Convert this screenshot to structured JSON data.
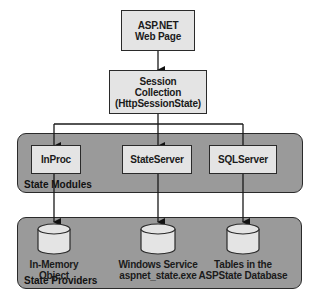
{
  "diagram": {
    "top": {
      "line1": "ASP.NET",
      "line2": "Web Page"
    },
    "session": {
      "line1": "Session",
      "line2": "Collection",
      "line3": "(HttpSessionState)"
    },
    "modules_panel": {
      "title": "State Modules",
      "items": [
        {
          "label": "InProc"
        },
        {
          "label": "StateServer"
        },
        {
          "label": "SQLServer"
        }
      ]
    },
    "providers_panel": {
      "title": "State Providers",
      "items": [
        {
          "line1": "In-Memory",
          "line2": "Object"
        },
        {
          "line1": "Windows Service",
          "line2": "aspnet_state.exe"
        },
        {
          "line1": "Tables in the",
          "line2": "ASPState Database"
        }
      ]
    },
    "colors": {
      "box_fill": "#e4e4e4",
      "panel_fill": "#9a9a9a",
      "stroke": "#2a2a2a",
      "background": "#ffffff"
    }
  }
}
